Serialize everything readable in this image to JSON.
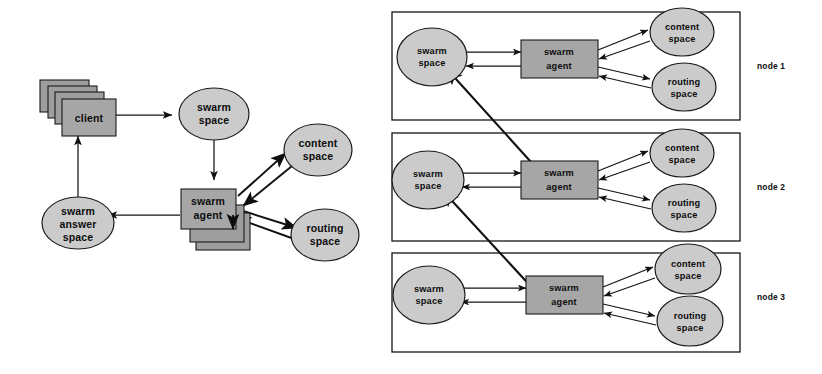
{
  "figure": {
    "kind": "architecture-diagram",
    "title": "",
    "background_color": "#ffffff",
    "colors": {
      "box_fill": "#a6a6a6",
      "ellipse_fill": "#cbcbcb",
      "stroke": "#1a1a1a",
      "text": "#0d0d0d"
    }
  },
  "left_diagram": {
    "name": "single-node-swarm-flow",
    "nodes": {
      "client": {
        "label_line1": "client",
        "shape": "stacked-box",
        "stack_count": 4
      },
      "swarm_space": {
        "label_line1": "swarm",
        "label_line2": "space",
        "shape": "ellipse"
      },
      "swarm_agent": {
        "label_line1": "swarm",
        "label_line2": "agent",
        "shape": "stacked-box",
        "stack_count": 3
      },
      "content_space": {
        "label_line1": "content",
        "label_line2": "space",
        "shape": "ellipse"
      },
      "routing_space": {
        "label_line1": "routing",
        "label_line2": "space",
        "shape": "ellipse"
      },
      "swarm_answer_space": {
        "label_line1": "swarm",
        "label_line2": "answer",
        "label_line3": "space",
        "shape": "ellipse"
      }
    },
    "edges": [
      {
        "from": "client",
        "to": "swarm_space",
        "direction": "one-way"
      },
      {
        "from": "swarm_space",
        "to": "swarm_agent",
        "direction": "one-way"
      },
      {
        "from": "swarm_agent",
        "to": "swarm_answer_space",
        "direction": "one-way"
      },
      {
        "from": "swarm_answer_space",
        "to": "client",
        "direction": "one-way"
      },
      {
        "from": "swarm_agent",
        "to": "content_space",
        "direction": "two-way"
      },
      {
        "from": "swarm_agent",
        "to": "routing_space",
        "direction": "two-way"
      }
    ]
  },
  "right_diagram": {
    "name": "multi-node-swarm-network",
    "nodes": [
      {
        "id": "node1",
        "label": "node 1",
        "members": {
          "swarm_space": {
            "label_line1": "swarm",
            "label_line2": "space"
          },
          "swarm_agent": {
            "label_line1": "swarm",
            "label_line2": "agent"
          },
          "content_space": {
            "label_line1": "content",
            "label_line2": "space"
          },
          "routing_space": {
            "label_line1": "routing",
            "label_line2": "space"
          }
        }
      },
      {
        "id": "node2",
        "label": "node 2",
        "members": {
          "swarm_space": {
            "label_line1": "swarm",
            "label_line2": "space"
          },
          "swarm_agent": {
            "label_line1": "swarm",
            "label_line2": "agent"
          },
          "content_space": {
            "label_line1": "content",
            "label_line2": "space"
          },
          "routing_space": {
            "label_line1": "routing",
            "label_line2": "space"
          }
        }
      },
      {
        "id": "node3",
        "label": "node 3",
        "members": {
          "swarm_space": {
            "label_line1": "swarm",
            "label_line2": "space"
          },
          "swarm_agent": {
            "label_line1": "swarm",
            "label_line2": "agent"
          },
          "content_space": {
            "label_line1": "content",
            "label_line2": "space"
          },
          "routing_space": {
            "label_line1": "routing",
            "label_line2": "space"
          }
        }
      }
    ],
    "inter_node_edges": [
      {
        "from": "node2.swarm_agent",
        "to": "node1.swarm_space",
        "direction": "one-way"
      },
      {
        "from": "node3.swarm_agent",
        "to": "node2.swarm_space",
        "direction": "one-way"
      }
    ]
  }
}
